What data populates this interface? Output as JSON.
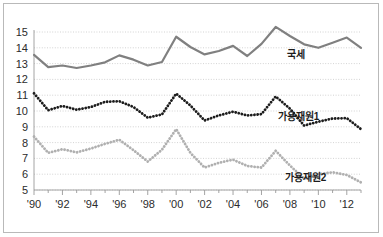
{
  "figure": {
    "background_color": "#ffffff",
    "border_color": "#b9b9b9",
    "gridline_color": "#c8c8c8",
    "axis_color": "#9a9a9a"
  },
  "chart_data": {
    "type": "line",
    "title": "",
    "subtitle": "",
    "xlabel": "",
    "ylabel": "",
    "xlim": [
      1990,
      2013
    ],
    "ylim": [
      5,
      15
    ],
    "grid": true,
    "legend_position": "inline-right",
    "x": [
      1990,
      1991,
      1992,
      1993,
      1994,
      1995,
      1996,
      1997,
      1998,
      1999,
      2000,
      2001,
      2002,
      2003,
      2004,
      2005,
      2006,
      2007,
      2008,
      2009,
      2010,
      2011,
      2012,
      2013
    ],
    "xtick_values": [
      1990,
      1992,
      1994,
      1996,
      1998,
      2000,
      2002,
      2004,
      2006,
      2008,
      2010,
      2012
    ],
    "xtick_labels": [
      "'90",
      "'92",
      "'94",
      "'96",
      "'98",
      "'00",
      "'02",
      "'04",
      "'06",
      "'08",
      "'10",
      "'12"
    ],
    "ytick_values": [
      5,
      6,
      7,
      8,
      9,
      10,
      11,
      12,
      13,
      14,
      15
    ],
    "ytick_labels": [
      "5",
      "6",
      "7",
      "8",
      "9",
      "10",
      "11",
      "12",
      "13",
      "14",
      "15"
    ],
    "series": [
      {
        "name": "국세",
        "label": "국세",
        "style": "solid",
        "color": "#808080",
        "width": 2.2,
        "label_x": 2008.4,
        "label_y": 13.35,
        "values": [
          13.55,
          12.78,
          12.88,
          12.72,
          12.88,
          13.08,
          13.52,
          13.25,
          12.88,
          13.1,
          14.7,
          14.05,
          13.58,
          13.8,
          14.12,
          13.48,
          14.25,
          15.32,
          14.75,
          14.22,
          14.0,
          14.32,
          14.65,
          14.0
        ]
      },
      {
        "name": "가용재원1",
        "label": "가용재원1",
        "style": "dotted",
        "color": "#1c1c1c",
        "width": 2.2,
        "label_x": 2008.6,
        "label_y": 9.42,
        "values": [
          11.12,
          10.05,
          10.32,
          10.08,
          10.25,
          10.58,
          10.62,
          10.25,
          9.58,
          9.78,
          11.1,
          10.35,
          9.4,
          9.72,
          9.95,
          9.72,
          9.8,
          10.92,
          10.15,
          9.08,
          9.32,
          9.52,
          9.55,
          8.85
        ]
      },
      {
        "name": "가용재원2",
        "label": "가용재원2",
        "style": "dotted",
        "color": "#b0b0b0",
        "width": 2.2,
        "label_x": 2009.1,
        "label_y": 5.55,
        "values": [
          8.38,
          7.35,
          7.58,
          7.38,
          7.62,
          7.92,
          8.18,
          7.52,
          6.8,
          7.55,
          8.85,
          7.35,
          6.42,
          6.72,
          6.92,
          6.52,
          6.42,
          7.48,
          6.55,
          5.72,
          6.0,
          6.12,
          5.95,
          5.48
        ]
      }
    ]
  }
}
